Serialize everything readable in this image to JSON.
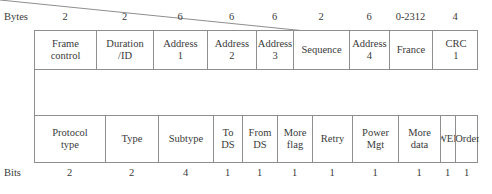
{
  "figure": {
    "bytes_axis_title": "Bytes",
    "bits_axis_title": "Bits",
    "line_color": "#8e8e8e",
    "text_color": "#3a3a3a"
  },
  "mac_frame": {
    "size_units": "Bytes",
    "fields": [
      {
        "label": "Frame\ncontrol",
        "size": "2",
        "width_px": 62
      },
      {
        "label": "Duration\n/ID",
        "size": "2",
        "width_px": 57
      },
      {
        "label": "Address\n1",
        "size": "6",
        "width_px": 54
      },
      {
        "label": "Address\n2",
        "size": "6",
        "width_px": 49
      },
      {
        "label": "Address\n3",
        "size": "6",
        "width_px": 37
      },
      {
        "label": "Sequence",
        "size": "2",
        "width_px": 56
      },
      {
        "label": "Address\n4",
        "size": "6",
        "width_px": 40
      },
      {
        "label": "France",
        "size": "0-2312",
        "width_px": 43
      },
      {
        "label": "CRC\n1",
        "size": "4",
        "width_px": 46
      }
    ]
  },
  "frame_control": {
    "size_units": "Bits",
    "fields": [
      {
        "label": "Protocol\ntype",
        "size": "2",
        "width_px": 71
      },
      {
        "label": "Type",
        "size": "2",
        "width_px": 53
      },
      {
        "label": "Subtype",
        "size": "4",
        "width_px": 55
      },
      {
        "label": "To\nDS",
        "size": "1",
        "width_px": 29
      },
      {
        "label": "From\nDS",
        "size": "1",
        "width_px": 35
      },
      {
        "label": "More\nflag",
        "size": "1",
        "width_px": 35
      },
      {
        "label": "Retry",
        "size": "1",
        "width_px": 40
      },
      {
        "label": "Power\nMgt",
        "size": "1",
        "width_px": 46
      },
      {
        "label": "More\ndata",
        "size": "1",
        "width_px": 42
      },
      {
        "label": "WEP",
        "size": "1",
        "width_px": 15
      },
      {
        "label": "Order",
        "size": "1",
        "width_px": 23
      }
    ]
  }
}
